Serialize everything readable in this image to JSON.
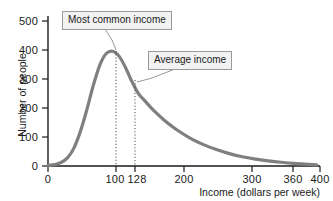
{
  "chart_data": {
    "type": "line",
    "title": "",
    "xlabel": "Income (dollars per week)",
    "ylabel": "Number of people",
    "xlim": [
      0,
      420
    ],
    "ylim": [
      0,
      520
    ],
    "grid": false,
    "legend": "none",
    "xticks": [
      {
        "value": 0,
        "label": "0"
      },
      {
        "value": 100,
        "label": "100"
      },
      {
        "value": 128,
        "label": "128"
      },
      {
        "value": 200,
        "label": "200"
      },
      {
        "value": 300,
        "label": "300"
      },
      {
        "value": 360,
        "label": "360"
      },
      {
        "value": 400,
        "label": "400"
      }
    ],
    "yticks": [
      {
        "value": 0,
        "label": "0"
      },
      {
        "value": 100,
        "label": "100"
      },
      {
        "value": 200,
        "label": "200"
      },
      {
        "value": 300,
        "label": "300"
      },
      {
        "value": 400,
        "label": "400"
      },
      {
        "value": 500,
        "label": "500"
      }
    ],
    "series": [
      {
        "name": "Income distribution",
        "color": "#7f7f7f",
        "x": [
          0,
          10,
          20,
          30,
          40,
          50,
          60,
          70,
          80,
          90,
          100,
          110,
          120,
          128,
          140,
          150,
          160,
          170,
          180,
          190,
          200,
          220,
          240,
          260,
          280,
          300,
          320,
          340,
          360,
          380,
          400,
          415
        ],
        "values": [
          2,
          5,
          12,
          28,
          62,
          120,
          195,
          280,
          350,
          390,
          398,
          380,
          340,
          300,
          250,
          225,
          200,
          178,
          158,
          140,
          124,
          96,
          74,
          57,
          43,
          32,
          24,
          18,
          13,
          9,
          6,
          4
        ]
      }
    ],
    "markers": [
      {
        "name": "most-common-income",
        "x": 100,
        "y": 398,
        "style": "dotted-vertical",
        "color": "#4d4d4d"
      },
      {
        "name": "average-income",
        "x": 128,
        "y": 300,
        "style": "dotted-vertical",
        "color": "#4d4d4d"
      }
    ],
    "annotations": [
      {
        "id": "most-common",
        "text": "Most common income",
        "target_x": 100,
        "target_y": 398
      },
      {
        "id": "average",
        "text": "Average income",
        "target_x": 128,
        "target_y": 300
      }
    ],
    "colors": {
      "curve": "#7f7f7f",
      "axis": "#1a1a1a",
      "callout_fill": "#f2f2f2",
      "callout_border": "#9a9a9a",
      "leader_line": "#8c8c8c",
      "marker_line": "#4d4d4d"
    }
  }
}
